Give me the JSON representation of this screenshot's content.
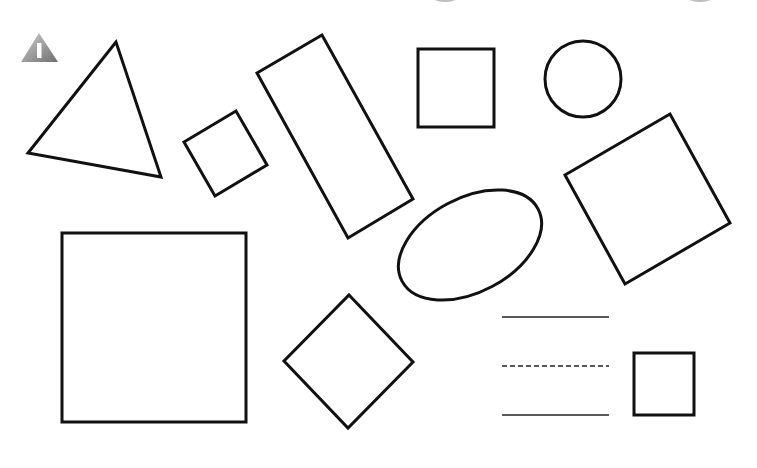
{
  "worksheet": {
    "title": "Shapes worksheet",
    "section_icon": {
      "name": "warning-icon",
      "glyph": "I",
      "colors": {
        "light": "#c8c8c8",
        "dark": "#7a7a7a",
        "glyph": "#ffffff"
      }
    },
    "stroke_color": "#111111",
    "background": "#ffffff",
    "shapes": [
      {
        "id": "triangle",
        "type": "polygon",
        "points": "116,42 28,153 161,177"
      },
      {
        "id": "small-rotated-square",
        "type": "polygon",
        "points": "184,142 236,111 267,165 215,196"
      },
      {
        "id": "long-rectangle",
        "type": "polygon",
        "points": "257,73 322,35 413,199 348,238"
      },
      {
        "id": "square-top",
        "type": "rect",
        "x": 418,
        "y": 49,
        "w": 76,
        "h": 78
      },
      {
        "id": "circle",
        "type": "circle",
        "cx": 583,
        "cy": 79,
        "r": 38
      },
      {
        "id": "right-rotated-square",
        "type": "polygon",
        "points": "565,175 670,114 730,223 625,284"
      },
      {
        "id": "ellipse",
        "type": "ellipse",
        "cx": 470,
        "cy": 245,
        "rx": 77,
        "ry": 47,
        "rotate": -28
      },
      {
        "id": "large-square",
        "type": "rect",
        "x": 62,
        "y": 233,
        "w": 184,
        "h": 189
      },
      {
        "id": "diamond",
        "type": "polygon",
        "points": "349,295 413,362 348,428 284,361"
      },
      {
        "id": "small-square-bottom",
        "type": "rect",
        "x": 634,
        "y": 353,
        "w": 60,
        "h": 62
      }
    ],
    "writing_lines": [
      {
        "y": 317,
        "x1": 502,
        "x2": 609,
        "style": "solid"
      },
      {
        "y": 366,
        "x1": 502,
        "x2": 609,
        "style": "dashed"
      },
      {
        "y": 415,
        "x1": 502,
        "x2": 609,
        "style": "solid"
      }
    ],
    "cropped_top_marks": [
      {
        "cx": 445,
        "cy": -6,
        "rx": 16,
        "ry": 8
      },
      {
        "cx": 700,
        "cy": -6,
        "rx": 16,
        "ry": 8
      }
    ]
  }
}
